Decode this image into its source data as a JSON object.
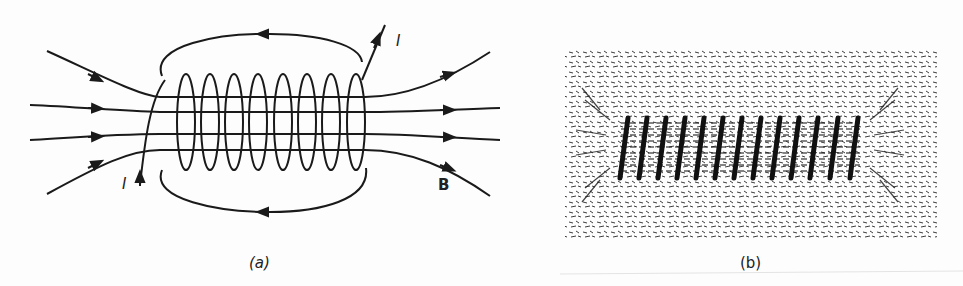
{
  "figure": {
    "panel_a": {
      "caption": "(a)",
      "labels": {
        "current_top": "I",
        "current_bottom": "I",
        "field": "B"
      },
      "description": "Solenoid with magnetic field lines B passing through the coil; current I enters bottom-left and exits top-right",
      "coil_turns": 8
    },
    "panel_b": {
      "caption": "(b)",
      "description": "Iron filings pattern around a current-carrying solenoid",
      "coil_turns": 13
    },
    "colors": {
      "ink": "#1a1a1a",
      "background": "#fdfdfd"
    }
  }
}
